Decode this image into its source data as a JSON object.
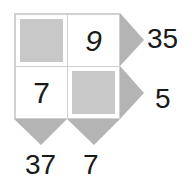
{
  "puzzle": {
    "cells": [
      {
        "row": 0,
        "col": 0,
        "shaded": true,
        "value": ""
      },
      {
        "row": 0,
        "col": 1,
        "shaded": false,
        "value": "9"
      },
      {
        "row": 1,
        "col": 0,
        "shaded": false,
        "value": "7"
      },
      {
        "row": 1,
        "col": 1,
        "shaded": true,
        "value": ""
      }
    ],
    "row_clues": [
      "35",
      "5"
    ],
    "col_clues": [
      "37",
      "7"
    ],
    "colors": {
      "border": "#d0d0d0",
      "shade": "#c8c8c8",
      "arrow": "#b4b4b4",
      "text": "#1a1a1a"
    }
  }
}
